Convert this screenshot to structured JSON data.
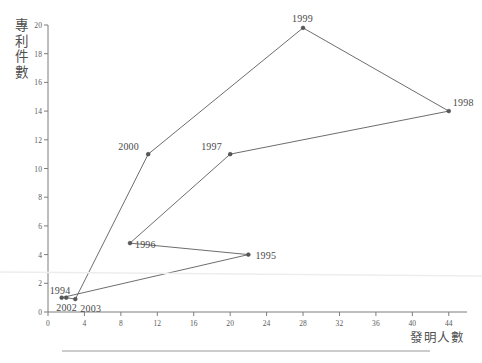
{
  "chart_data": {
    "type": "scatter",
    "title": "",
    "xlabel": "發明人數",
    "ylabel": "專利件數",
    "xlim": [
      0,
      46
    ],
    "ylim": [
      0,
      20
    ],
    "xticks": [
      0,
      4,
      8,
      12,
      16,
      20,
      24,
      28,
      32,
      36,
      40,
      44
    ],
    "yticks": [
      0,
      2,
      4,
      6,
      8,
      10,
      12,
      14,
      16,
      18,
      20
    ],
    "grid": false,
    "legend": "none",
    "connected": true,
    "connection_order": [
      "1994",
      "1995",
      "1996",
      "1997",
      "1998",
      "1999",
      "2000",
      "2003",
      "2002"
    ],
    "points": [
      {
        "label": "1994",
        "x": 1.5,
        "y": 1.0,
        "label_dx": -12,
        "label_dy": -13
      },
      {
        "label": "1995",
        "x": 22.0,
        "y": 4.0,
        "label_dx": 7,
        "label_dy": -5
      },
      {
        "label": "1996",
        "x": 9.0,
        "y": 4.8,
        "label_dx": 5,
        "label_dy": -4
      },
      {
        "label": "1997",
        "x": 20.0,
        "y": 11.0,
        "label_dx": -29,
        "label_dy": -13
      },
      {
        "label": "1998",
        "x": 44.0,
        "y": 14.0,
        "label_dx": 4,
        "label_dy": -14
      },
      {
        "label": "1999",
        "x": 28.0,
        "y": 19.8,
        "label_dx": -11,
        "label_dy": -15
      },
      {
        "label": "2000",
        "x": 11.0,
        "y": 11.0,
        "label_dx": -30,
        "label_dy": -13
      },
      {
        "label": "2002",
        "x": 2.0,
        "y": 1.0,
        "label_dx": -10,
        "label_dy": 4
      },
      {
        "label": "2003",
        "x": 3.0,
        "y": 0.9,
        "label_dx": 5,
        "label_dy": 4
      }
    ]
  },
  "axis": {
    "y_title_chars": [
      "專",
      "利",
      "件",
      "數"
    ],
    "x_title": "發明人數"
  },
  "colors": {
    "line": "#5c5c5c",
    "marker": "#585858",
    "axis": "#7d7d7d",
    "text": "#4a4a4a",
    "background": "#ffffff"
  }
}
